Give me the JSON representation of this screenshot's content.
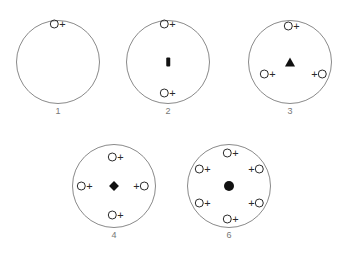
{
  "figure": {
    "title": "",
    "background_color": "#ffffff",
    "ring_stroke_color": "#8a8a8a",
    "glyph_color": "#2a2a2a",
    "marker_color": "#111111",
    "caption_color": "#777777"
  },
  "tokens": {
    "o_symbol": "O",
    "plus_symbol": "+"
  },
  "diagrams": [
    {
      "caption": "1",
      "center_marker": "none",
      "cx": 58,
      "cy": 62,
      "r": 42,
      "caption_y": 106,
      "ligands": [
        {
          "name": "ligand-top",
          "x": 58,
          "y": 24,
          "order": "o-plus"
        }
      ]
    },
    {
      "caption": "2",
      "center_marker": "bar",
      "cx": 168,
      "cy": 62,
      "r": 42,
      "caption_y": 106,
      "ligands": [
        {
          "name": "ligand-top",
          "x": 168,
          "y": 24,
          "order": "o-plus"
        },
        {
          "name": "ligand-bottom",
          "x": 168,
          "y": 93,
          "order": "o-plus"
        }
      ]
    },
    {
      "caption": "3",
      "center_marker": "triangle",
      "cx": 290,
      "cy": 62,
      "r": 42,
      "caption_y": 106,
      "ligands": [
        {
          "name": "ligand-top",
          "x": 292,
          "y": 26,
          "order": "o-plus"
        },
        {
          "name": "ligand-lower-left",
          "x": 268,
          "y": 74,
          "order": "o-plus"
        },
        {
          "name": "ligand-lower-right",
          "x": 319,
          "y": 74,
          "order": "plus-o"
        }
      ]
    },
    {
      "caption": "4",
      "center_marker": "diamond",
      "cx": 114,
      "cy": 186,
      "r": 42,
      "caption_y": 230,
      "ligands": [
        {
          "name": "ligand-top",
          "x": 116,
          "y": 157,
          "order": "o-plus"
        },
        {
          "name": "ligand-left",
          "x": 85,
          "y": 186,
          "order": "o-plus"
        },
        {
          "name": "ligand-right",
          "x": 141,
          "y": 186,
          "order": "plus-o"
        },
        {
          "name": "ligand-bottom",
          "x": 116,
          "y": 215,
          "order": "o-plus"
        }
      ]
    },
    {
      "caption": "6",
      "center_marker": "dot",
      "cx": 229,
      "cy": 186,
      "r": 42,
      "caption_y": 230,
      "ligands": [
        {
          "name": "ligand-top",
          "x": 231,
          "y": 153,
          "order": "o-plus"
        },
        {
          "name": "ligand-upper-left",
          "x": 203,
          "y": 169,
          "order": "o-plus"
        },
        {
          "name": "ligand-upper-right",
          "x": 256,
          "y": 169,
          "order": "plus-o"
        },
        {
          "name": "ligand-lower-left",
          "x": 203,
          "y": 203,
          "order": "o-plus"
        },
        {
          "name": "ligand-lower-right",
          "x": 256,
          "y": 203,
          "order": "plus-o"
        },
        {
          "name": "ligand-bottom",
          "x": 231,
          "y": 219,
          "order": "o-plus"
        }
      ]
    }
  ]
}
